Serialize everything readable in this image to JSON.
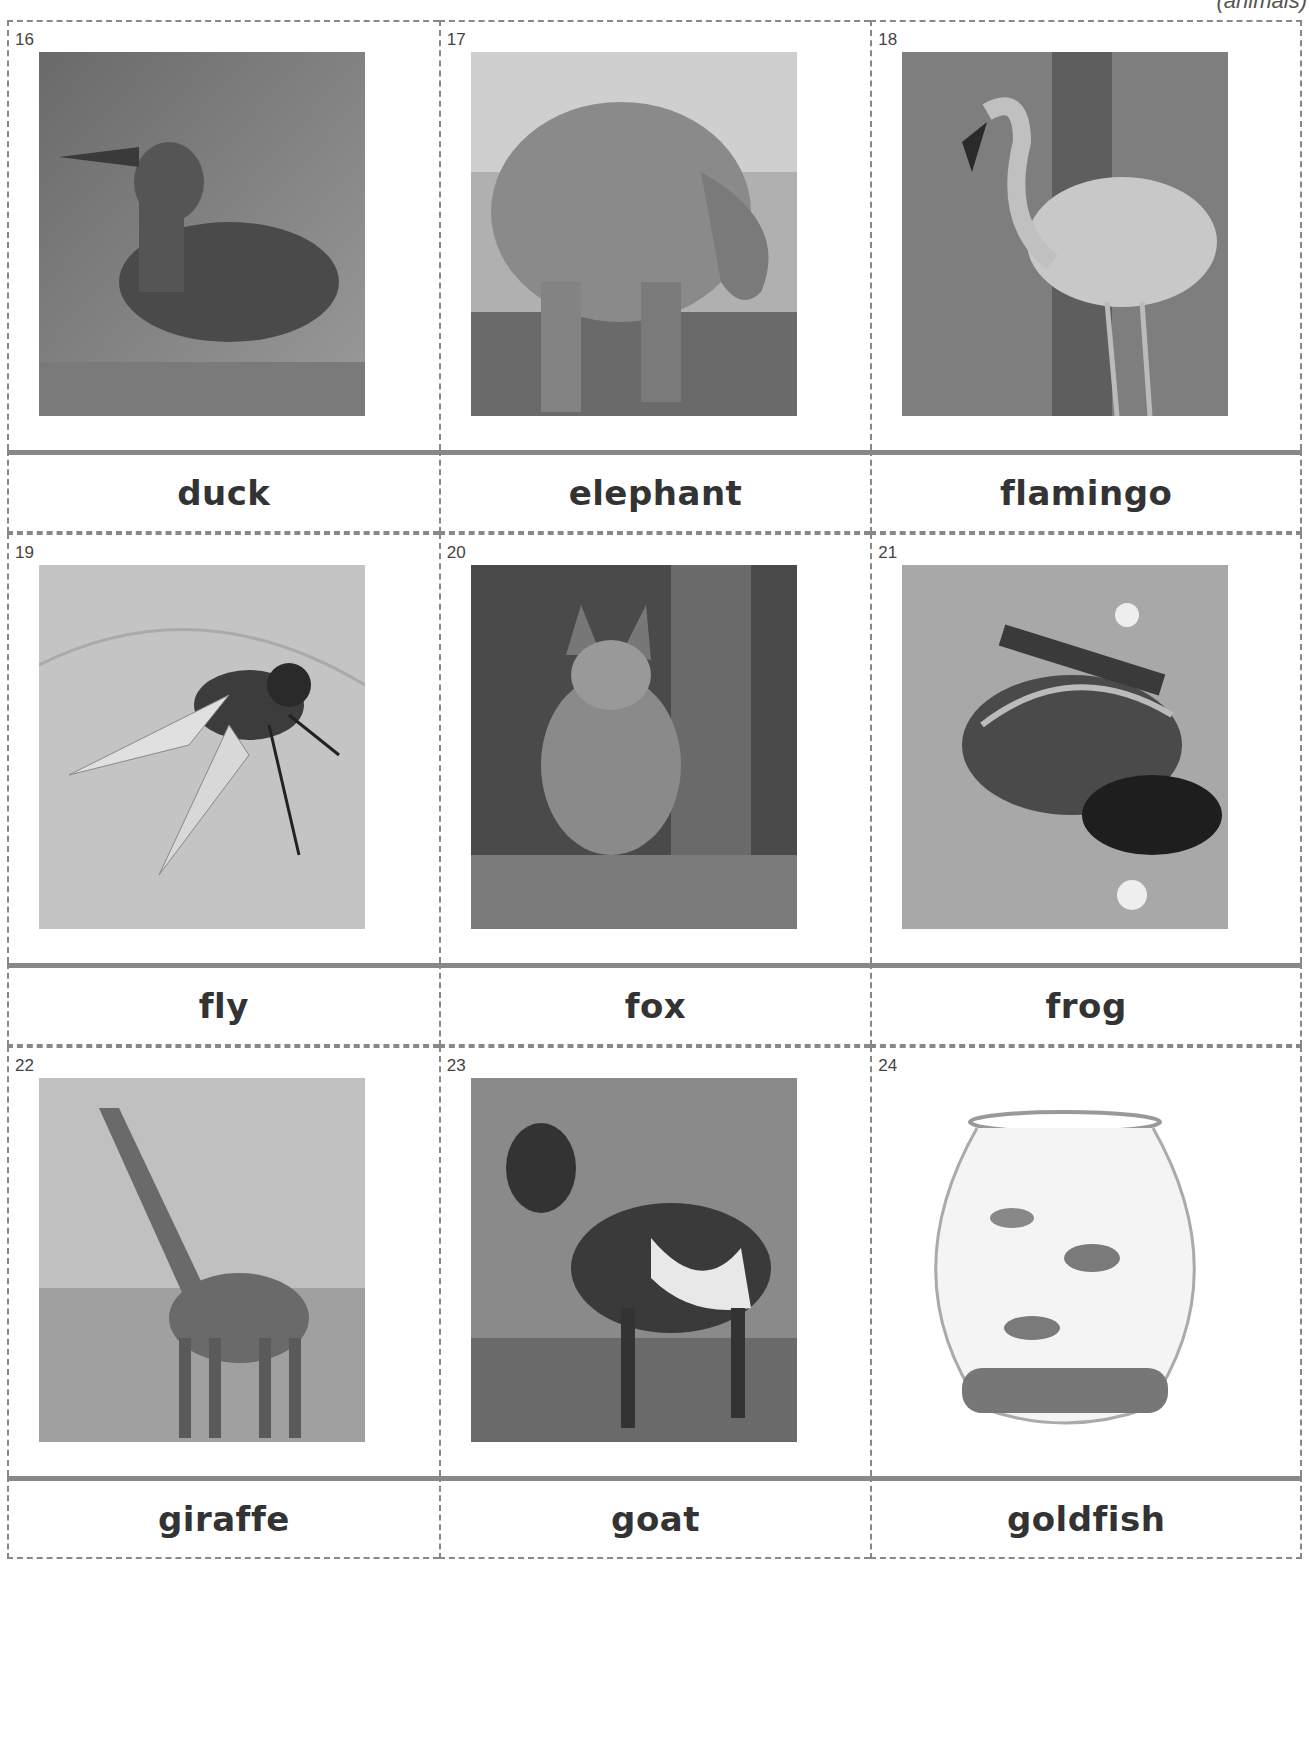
{
  "header": {
    "category_tag": "(animals)"
  },
  "cards": [
    {
      "number": "16",
      "word": "duck",
      "image": "duck-photo"
    },
    {
      "number": "17",
      "word": "elephant",
      "image": "elephant-photo"
    },
    {
      "number": "18",
      "word": "flamingo",
      "image": "flamingo-photo"
    },
    {
      "number": "19",
      "word": "fly",
      "image": "fly-photo"
    },
    {
      "number": "20",
      "word": "fox",
      "image": "fox-photo"
    },
    {
      "number": "21",
      "word": "frog",
      "image": "frog-photo"
    },
    {
      "number": "22",
      "word": "giraffe",
      "image": "giraffe-photo"
    },
    {
      "number": "23",
      "word": "goat",
      "image": "goat-photo"
    },
    {
      "number": "24",
      "word": "goldfish",
      "image": "goldfish-photo"
    }
  ],
  "colors": {
    "cut_line": "#888888",
    "fold_line": "#888888",
    "text": "#333333"
  }
}
